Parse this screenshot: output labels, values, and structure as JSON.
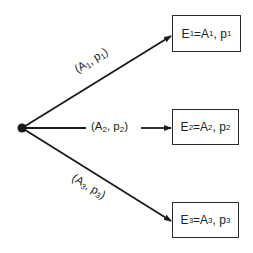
{
  "diagram": {
    "type": "decision-tree",
    "root": {
      "label": "",
      "shape": "filled-circle"
    },
    "branches": [
      {
        "edge_label": {
          "a": "A",
          "a_sub": "1",
          "p": "p",
          "p_sub": "1"
        },
        "outcome": {
          "e": "E",
          "e_sub": "1",
          "a": "A",
          "a_sub": "1",
          "p": "p",
          "p_sub": "1"
        }
      },
      {
        "edge_label": {
          "a": "A",
          "a_sub": "2",
          "p": "p",
          "p_sub": "2"
        },
        "outcome": {
          "e": "E",
          "e_sub": "2",
          "a": "A",
          "a_sub": "2",
          "p": "p",
          "p_sub": "2"
        }
      },
      {
        "edge_label": {
          "a": "A",
          "a_sub": "3",
          "p": "p",
          "p_sub": "3"
        },
        "outcome": {
          "e": "E",
          "e_sub": "3",
          "a": "A",
          "a_sub": "3",
          "p": "p",
          "p_sub": "3"
        }
      }
    ],
    "colors": {
      "stroke": "#1a1a1a",
      "text": "#222222",
      "background": "#ffffff"
    }
  }
}
